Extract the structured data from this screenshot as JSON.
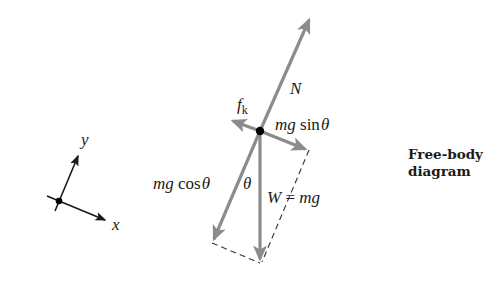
{
  "diagram": {
    "caption_line1": "Free-body",
    "caption_line2": "diagram",
    "colors": {
      "force_arrow": "#8c8c8c",
      "axis": "#1a1a1a",
      "dashed": "#333333",
      "dot": "#000000",
      "background": "#ffffff"
    },
    "forces": {
      "normal": {
        "symbol": "N"
      },
      "friction": {
        "symbol": "f",
        "subscript": "k"
      },
      "parallel_component": {
        "prefix": "mg",
        "func": "sin",
        "angle": "θ"
      },
      "perpendicular_component": {
        "prefix": "mg",
        "func": "cos",
        "angle": "θ"
      },
      "weight": {
        "lhs": "W",
        "eq": "=",
        "rhs": "mg"
      }
    },
    "angle_label": "θ",
    "axes": {
      "x_label": "x",
      "y_label": "y"
    }
  }
}
